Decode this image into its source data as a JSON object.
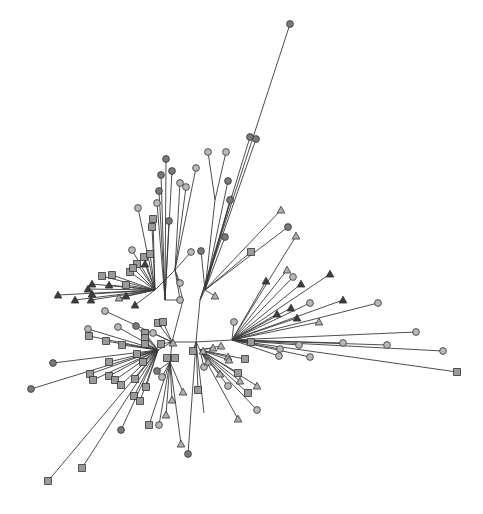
{
  "diagram": {
    "type": "unrooted-phylogenetic-tree",
    "width": 483,
    "height": 514,
    "colors": {
      "edge": "#3a3a3a",
      "circle_dark": "#7a7a7a",
      "circle_light": "#b8b8b8",
      "square": "#9a9a9a",
      "triangle_dark": "#3c3c3c",
      "triangle_light": "#b0b0b0",
      "outline": "#333333"
    },
    "internal": {
      "L": [
        172,
        342
      ],
      "R": [
        196,
        342
      ],
      "LU": [
        183,
        300
      ],
      "RU": [
        200,
        300
      ],
      "A": [
        158,
        350
      ],
      "B": [
        170,
        362
      ],
      "C": [
        200,
        350
      ],
      "D": [
        232,
        340
      ],
      "E": [
        165,
        300
      ],
      "F": [
        205,
        290
      ],
      "G": [
        232,
        195
      ],
      "H": [
        215,
        200
      ],
      "I": [
        175,
        270
      ],
      "J": [
        155,
        290
      ]
    },
    "leaves": [
      {
        "x": 290,
        "y": 24,
        "shape": "circle",
        "tone": "dark",
        "parent": "RU"
      },
      {
        "x": 250,
        "y": 137,
        "shape": "circle",
        "tone": "dark",
        "parent": "RU"
      },
      {
        "x": 256,
        "y": 139,
        "shape": "circle",
        "tone": "dark",
        "parent": "RU"
      },
      {
        "x": 208,
        "y": 152,
        "shape": "circle",
        "tone": "light",
        "parent": "H"
      },
      {
        "x": 226,
        "y": 152,
        "shape": "circle",
        "tone": "light",
        "parent": "H"
      },
      {
        "x": 228,
        "y": 181,
        "shape": "circle",
        "tone": "dark",
        "parent": "F"
      },
      {
        "x": 230,
        "y": 200,
        "shape": "circle",
        "tone": "dark",
        "parent": "F"
      },
      {
        "x": 225,
        "y": 237,
        "shape": "circle",
        "tone": "dark",
        "parent": "F"
      },
      {
        "x": 201,
        "y": 251,
        "shape": "circle",
        "tone": "dark",
        "parent": "F"
      },
      {
        "x": 191,
        "y": 252,
        "shape": "circle",
        "tone": "light",
        "parent": "I"
      },
      {
        "x": 196,
        "y": 168,
        "shape": "circle",
        "tone": "light",
        "parent": "I"
      },
      {
        "x": 180,
        "y": 183,
        "shape": "circle",
        "tone": "light",
        "parent": "I"
      },
      {
        "x": 186,
        "y": 187,
        "shape": "circle",
        "tone": "light",
        "parent": "I"
      },
      {
        "x": 166,
        "y": 159,
        "shape": "circle",
        "tone": "dark",
        "parent": "E"
      },
      {
        "x": 172,
        "y": 171,
        "shape": "circle",
        "tone": "dark",
        "parent": "E"
      },
      {
        "x": 161,
        "y": 175,
        "shape": "circle",
        "tone": "dark",
        "parent": "E"
      },
      {
        "x": 159,
        "y": 191,
        "shape": "circle",
        "tone": "dark",
        "parent": "E"
      },
      {
        "x": 157,
        "y": 203,
        "shape": "circle",
        "tone": "light",
        "parent": "E"
      },
      {
        "x": 169,
        "y": 221,
        "shape": "circle",
        "tone": "dark",
        "parent": "E"
      },
      {
        "x": 138,
        "y": 208,
        "shape": "circle",
        "tone": "light",
        "parent": "J"
      },
      {
        "x": 153,
        "y": 219,
        "shape": "square",
        "tone": "mid",
        "parent": "J"
      },
      {
        "x": 152,
        "y": 227,
        "shape": "square",
        "tone": "mid",
        "parent": "J"
      },
      {
        "x": 180,
        "y": 283,
        "shape": "circle",
        "tone": "light",
        "parent": "I"
      },
      {
        "x": 180,
        "y": 300,
        "shape": "circle",
        "tone": "light",
        "parent": "I"
      },
      {
        "x": 132,
        "y": 250,
        "shape": "circle",
        "tone": "light",
        "parent": "J"
      },
      {
        "x": 144,
        "y": 257,
        "shape": "square",
        "tone": "mid",
        "parent": "J"
      },
      {
        "x": 150,
        "y": 254,
        "shape": "square",
        "tone": "mid",
        "parent": "J"
      },
      {
        "x": 137,
        "y": 264,
        "shape": "square",
        "tone": "mid",
        "parent": "J"
      },
      {
        "x": 145,
        "y": 264,
        "shape": "triangle",
        "tone": "dark",
        "parent": "J"
      },
      {
        "x": 130,
        "y": 272,
        "shape": "square",
        "tone": "mid",
        "parent": "J"
      },
      {
        "x": 133,
        "y": 268,
        "shape": "square",
        "tone": "mid",
        "parent": "J"
      },
      {
        "x": 102,
        "y": 276,
        "shape": "square",
        "tone": "mid",
        "parent": "J"
      },
      {
        "x": 112,
        "y": 275,
        "shape": "square",
        "tone": "mid",
        "parent": "J"
      },
      {
        "x": 126,
        "y": 285,
        "shape": "square",
        "tone": "mid",
        "parent": "J"
      },
      {
        "x": 58,
        "y": 295,
        "shape": "triangle",
        "tone": "dark",
        "parent": "J"
      },
      {
        "x": 92,
        "y": 284,
        "shape": "triangle",
        "tone": "dark",
        "parent": "J"
      },
      {
        "x": 88,
        "y": 289,
        "shape": "triangle",
        "tone": "dark",
        "parent": "J"
      },
      {
        "x": 109,
        "y": 285,
        "shape": "triangle",
        "tone": "dark",
        "parent": "J"
      },
      {
        "x": 75,
        "y": 300,
        "shape": "triangle",
        "tone": "dark",
        "parent": "J"
      },
      {
        "x": 91,
        "y": 300,
        "shape": "triangle",
        "tone": "dark",
        "parent": "J"
      },
      {
        "x": 92,
        "y": 294,
        "shape": "triangle",
        "tone": "dark",
        "parent": "J"
      },
      {
        "x": 119,
        "y": 298,
        "shape": "triangle",
        "tone": "light",
        "parent": "J"
      },
      {
        "x": 126,
        "y": 296,
        "shape": "triangle",
        "tone": "dark",
        "parent": "J"
      },
      {
        "x": 135,
        "y": 305,
        "shape": "triangle",
        "tone": "dark",
        "parent": "J"
      },
      {
        "x": 105,
        "y": 311,
        "shape": "circle",
        "tone": "light",
        "parent": "L"
      },
      {
        "x": 158,
        "y": 323,
        "shape": "square",
        "tone": "mid",
        "parent": "L"
      },
      {
        "x": 163,
        "y": 322,
        "shape": "square",
        "tone": "mid",
        "parent": "L"
      },
      {
        "x": 88,
        "y": 329,
        "shape": "circle",
        "tone": "light",
        "parent": "A"
      },
      {
        "x": 118,
        "y": 327,
        "shape": "circle",
        "tone": "light",
        "parent": "A"
      },
      {
        "x": 136,
        "y": 326,
        "shape": "circle",
        "tone": "dark",
        "parent": "A"
      },
      {
        "x": 145,
        "y": 333,
        "shape": "square",
        "tone": "mid",
        "parent": "A"
      },
      {
        "x": 153,
        "y": 333,
        "shape": "circle",
        "tone": "light",
        "parent": "L"
      },
      {
        "x": 89,
        "y": 336,
        "shape": "square",
        "tone": "mid",
        "parent": "A"
      },
      {
        "x": 106,
        "y": 341,
        "shape": "square",
        "tone": "mid",
        "parent": "A"
      },
      {
        "x": 122,
        "y": 345,
        "shape": "square",
        "tone": "mid",
        "parent": "A"
      },
      {
        "x": 145,
        "y": 338,
        "shape": "square",
        "tone": "mid",
        "parent": "A"
      },
      {
        "x": 145,
        "y": 344,
        "shape": "square",
        "tone": "mid",
        "parent": "A"
      },
      {
        "x": 161,
        "y": 344,
        "shape": "square",
        "tone": "mid",
        "parent": "L"
      },
      {
        "x": 173,
        "y": 343,
        "shape": "triangle",
        "tone": "light",
        "parent": "L"
      },
      {
        "x": 53,
        "y": 363,
        "shape": "circle",
        "tone": "dark",
        "parent": "A"
      },
      {
        "x": 31,
        "y": 389,
        "shape": "circle",
        "tone": "dark",
        "parent": "A"
      },
      {
        "x": 137,
        "y": 354,
        "shape": "square",
        "tone": "mid",
        "parent": "A"
      },
      {
        "x": 109,
        "y": 362,
        "shape": "square",
        "tone": "mid",
        "parent": "A"
      },
      {
        "x": 143,
        "y": 362,
        "shape": "square",
        "tone": "mid",
        "parent": "A"
      },
      {
        "x": 90,
        "y": 374,
        "shape": "square",
        "tone": "mid",
        "parent": "A"
      },
      {
        "x": 93,
        "y": 380,
        "shape": "square",
        "tone": "mid",
        "parent": "A"
      },
      {
        "x": 109,
        "y": 376,
        "shape": "square",
        "tone": "mid",
        "parent": "A"
      },
      {
        "x": 115,
        "y": 380,
        "shape": "square",
        "tone": "mid",
        "parent": "A"
      },
      {
        "x": 121,
        "y": 385,
        "shape": "square",
        "tone": "mid",
        "parent": "A"
      },
      {
        "x": 135,
        "y": 379,
        "shape": "square",
        "tone": "mid",
        "parent": "A"
      },
      {
        "x": 146,
        "y": 387,
        "shape": "square",
        "tone": "mid",
        "parent": "A"
      },
      {
        "x": 134,
        "y": 396,
        "shape": "square",
        "tone": "mid",
        "parent": "A"
      },
      {
        "x": 140,
        "y": 401,
        "shape": "square",
        "tone": "mid",
        "parent": "A"
      },
      {
        "x": 121,
        "y": 430,
        "shape": "circle",
        "tone": "dark",
        "parent": "A"
      },
      {
        "x": 82,
        "y": 468,
        "shape": "square",
        "tone": "mid",
        "parent": "A"
      },
      {
        "x": 48,
        "y": 481,
        "shape": "square",
        "tone": "mid",
        "parent": "A"
      },
      {
        "x": 167,
        "y": 358,
        "shape": "square",
        "tone": "mid",
        "parent": "B"
      },
      {
        "x": 175,
        "y": 358,
        "shape": "square",
        "tone": "mid",
        "parent": "B"
      },
      {
        "x": 157,
        "y": 371,
        "shape": "circle",
        "tone": "dark",
        "parent": "B"
      },
      {
        "x": 162,
        "y": 377,
        "shape": "circle",
        "tone": "light",
        "parent": "B"
      },
      {
        "x": 183,
        "y": 392,
        "shape": "triangle",
        "tone": "light",
        "parent": "B"
      },
      {
        "x": 172,
        "y": 400,
        "shape": "triangle",
        "tone": "light",
        "parent": "B"
      },
      {
        "x": 166,
        "y": 415,
        "shape": "triangle",
        "tone": "light",
        "parent": "B"
      },
      {
        "x": 149,
        "y": 425,
        "shape": "square",
        "tone": "mid",
        "parent": "B"
      },
      {
        "x": 159,
        "y": 425,
        "shape": "circle",
        "tone": "light",
        "parent": "B"
      },
      {
        "x": 181,
        "y": 444,
        "shape": "triangle",
        "tone": "light",
        "parent": "B"
      },
      {
        "x": 188,
        "y": 454,
        "shape": "circle",
        "tone": "dark",
        "parent": "R"
      },
      {
        "x": 193,
        "y": 351,
        "shape": "square",
        "tone": "mid",
        "parent": "R"
      },
      {
        "x": 198,
        "y": 390,
        "shape": "square",
        "tone": "mid",
        "parent": "R"
      },
      {
        "x": 204,
        "y": 413,
        "shape": "leaf-end",
        "tone": "none",
        "parent": "R"
      },
      {
        "x": 203,
        "y": 351,
        "shape": "triangle",
        "tone": "light",
        "parent": "C"
      },
      {
        "x": 204,
        "y": 367,
        "shape": "circle",
        "tone": "light",
        "parent": "C"
      },
      {
        "x": 208,
        "y": 362,
        "shape": "triangle",
        "tone": "light",
        "parent": "C"
      },
      {
        "x": 213,
        "y": 348,
        "shape": "triangle",
        "tone": "light",
        "parent": "C"
      },
      {
        "x": 221,
        "y": 346,
        "shape": "triangle",
        "tone": "light",
        "parent": "C"
      },
      {
        "x": 228,
        "y": 357,
        "shape": "triangle",
        "tone": "light",
        "parent": "C"
      },
      {
        "x": 229,
        "y": 360,
        "shape": "triangle",
        "tone": "light",
        "parent": "C"
      },
      {
        "x": 245,
        "y": 359,
        "shape": "square",
        "tone": "mid",
        "parent": "C"
      },
      {
        "x": 220,
        "y": 374,
        "shape": "triangle",
        "tone": "light",
        "parent": "C"
      },
      {
        "x": 238,
        "y": 373,
        "shape": "square",
        "tone": "mid",
        "parent": "C"
      },
      {
        "x": 240,
        "y": 381,
        "shape": "triangle",
        "tone": "light",
        "parent": "C"
      },
      {
        "x": 228,
        "y": 386,
        "shape": "circle",
        "tone": "light",
        "parent": "C"
      },
      {
        "x": 257,
        "y": 386,
        "shape": "triangle",
        "tone": "light",
        "parent": "C"
      },
      {
        "x": 248,
        "y": 393,
        "shape": "square",
        "tone": "mid",
        "parent": "C"
      },
      {
        "x": 257,
        "y": 410,
        "shape": "circle",
        "tone": "light",
        "parent": "C"
      },
      {
        "x": 238,
        "y": 419,
        "shape": "triangle",
        "tone": "light",
        "parent": "C"
      },
      {
        "x": 234,
        "y": 322,
        "shape": "circle",
        "tone": "light",
        "parent": "D"
      },
      {
        "x": 251,
        "y": 342,
        "shape": "square",
        "tone": "mid",
        "parent": "D"
      },
      {
        "x": 280,
        "y": 349,
        "shape": "circle",
        "tone": "light",
        "parent": "D"
      },
      {
        "x": 279,
        "y": 356,
        "shape": "circle",
        "tone": "light",
        "parent": "D"
      },
      {
        "x": 299,
        "y": 345,
        "shape": "circle",
        "tone": "light",
        "parent": "D"
      },
      {
        "x": 310,
        "y": 357,
        "shape": "circle",
        "tone": "light",
        "parent": "D"
      },
      {
        "x": 343,
        "y": 343,
        "shape": "circle",
        "tone": "light",
        "parent": "D"
      },
      {
        "x": 387,
        "y": 345,
        "shape": "circle",
        "tone": "light",
        "parent": "D"
      },
      {
        "x": 416,
        "y": 332,
        "shape": "circle",
        "tone": "light",
        "parent": "D"
      },
      {
        "x": 443,
        "y": 351,
        "shape": "circle",
        "tone": "light",
        "parent": "D"
      },
      {
        "x": 457,
        "y": 372,
        "shape": "square",
        "tone": "mid",
        "parent": "D"
      },
      {
        "x": 378,
        "y": 303,
        "shape": "circle",
        "tone": "light",
        "parent": "D"
      },
      {
        "x": 319,
        "y": 322,
        "shape": "triangle",
        "tone": "light",
        "parent": "D"
      },
      {
        "x": 343,
        "y": 300,
        "shape": "triangle",
        "tone": "dark",
        "parent": "D"
      },
      {
        "x": 330,
        "y": 274,
        "shape": "triangle",
        "tone": "dark",
        "parent": "D"
      },
      {
        "x": 310,
        "y": 303,
        "shape": "circle",
        "tone": "light",
        "parent": "D"
      },
      {
        "x": 301,
        "y": 284,
        "shape": "triangle",
        "tone": "dark",
        "parent": "D"
      },
      {
        "x": 297,
        "y": 318,
        "shape": "triangle",
        "tone": "dark",
        "parent": "D"
      },
      {
        "x": 291,
        "y": 308,
        "shape": "triangle",
        "tone": "dark",
        "parent": "D"
      },
      {
        "x": 277,
        "y": 314,
        "shape": "triangle",
        "tone": "dark",
        "parent": "D"
      },
      {
        "x": 293,
        "y": 277,
        "shape": "circle",
        "tone": "light",
        "parent": "D"
      },
      {
        "x": 287,
        "y": 270,
        "shape": "triangle",
        "tone": "light",
        "parent": "D"
      },
      {
        "x": 266,
        "y": 281,
        "shape": "triangle",
        "tone": "dark",
        "parent": "D"
      },
      {
        "x": 296,
        "y": 236,
        "shape": "triangle",
        "tone": "light",
        "parent": "D"
      },
      {
        "x": 288,
        "y": 227,
        "shape": "circle",
        "tone": "dark",
        "parent": "F"
      },
      {
        "x": 281,
        "y": 210,
        "shape": "triangle",
        "tone": "light",
        "parent": "F"
      },
      {
        "x": 251,
        "y": 252,
        "shape": "square",
        "tone": "mid",
        "parent": "F"
      },
      {
        "x": 215,
        "y": 296,
        "shape": "triangle",
        "tone": "light",
        "parent": "F"
      }
    ]
  }
}
